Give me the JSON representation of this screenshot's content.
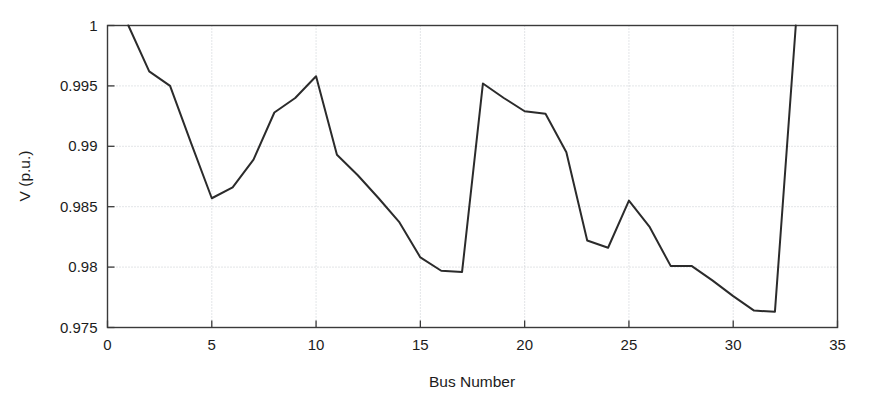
{
  "chart_data": {
    "type": "line",
    "title": "",
    "xlabel": "Bus Number",
    "ylabel": "V (p.u.)",
    "xlim": [
      0,
      35
    ],
    "ylim": [
      0.975,
      1
    ],
    "xticks": [
      0,
      5,
      10,
      15,
      20,
      25,
      30,
      35
    ],
    "yticks": [
      0.975,
      0.98,
      0.985,
      0.99,
      0.995,
      1
    ],
    "xtick_labels": [
      "0",
      "5",
      "10",
      "15",
      "20",
      "25",
      "30",
      "35"
    ],
    "ytick_labels": [
      "0.975",
      "0.98",
      "0.985",
      "0.99",
      "0.995",
      "1"
    ],
    "grid": true,
    "legend": null,
    "series": [
      {
        "name": "Bus voltage magnitude",
        "color": "#2b2b2b",
        "x": [
          1,
          2,
          3,
          4,
          5,
          6,
          7,
          8,
          9,
          10,
          11,
          12,
          13,
          14,
          15,
          16,
          17,
          18,
          19,
          20,
          21,
          22,
          23,
          24,
          25,
          26,
          27,
          28,
          29,
          30,
          31,
          32,
          33
        ],
        "values": [
          1.0,
          0.9962,
          0.995,
          0.9903,
          0.9857,
          0.9866,
          0.9889,
          0.9928,
          0.994,
          0.9958,
          0.9893,
          0.9876,
          0.9857,
          0.9837,
          0.9808,
          0.9797,
          0.9796,
          0.9952,
          0.994,
          0.9929,
          0.9927,
          0.9895,
          0.9822,
          0.9816,
          0.9855,
          0.9833,
          0.9801,
          0.9801,
          0.9789,
          0.9776,
          0.9764,
          0.9763,
          1.0
        ]
      }
    ]
  },
  "colors": {
    "line": "#2b2b2b",
    "grid": "#b9bec4",
    "frame": "#3a3a3a",
    "background": "#ffffff",
    "text": "#1c1c1c"
  }
}
